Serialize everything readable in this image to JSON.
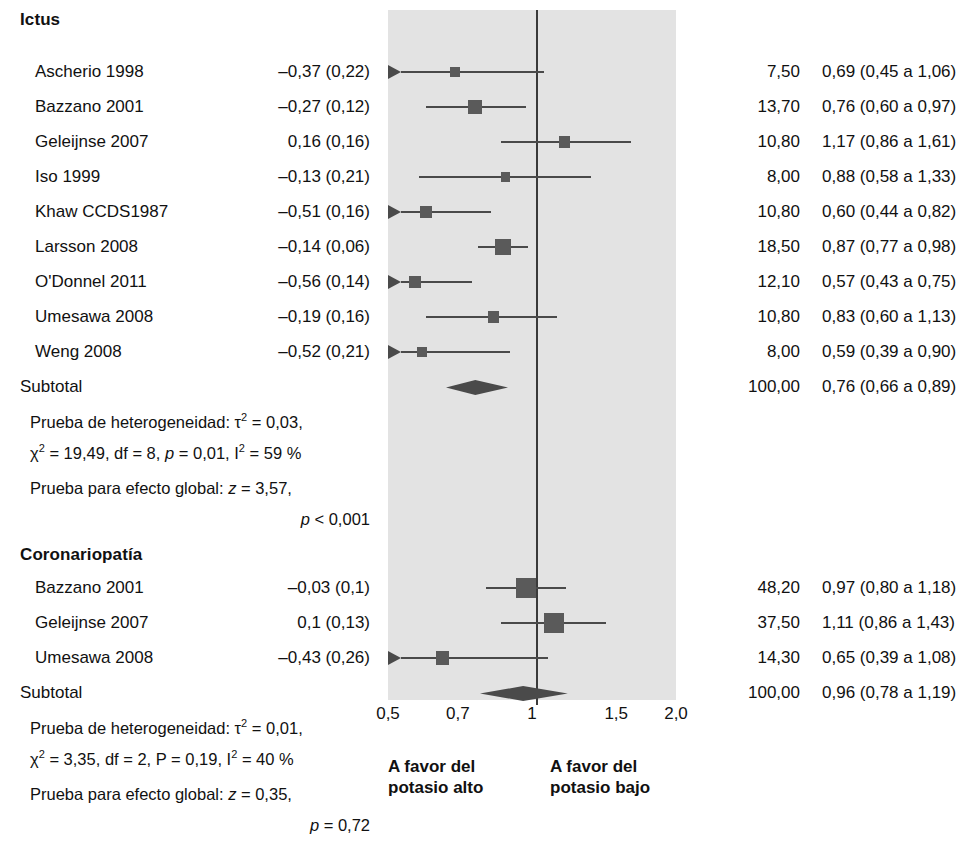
{
  "chart_data": {
    "type": "forest",
    "title": "",
    "xlabel": "",
    "axis": {
      "scale": "log",
      "ticks": [
        "0,5",
        "0,7",
        "1",
        "1,5",
        "2,0"
      ],
      "tick_values": [
        0.5,
        0.7,
        1.0,
        1.5,
        2.0
      ],
      "null_value": 1.0,
      "xlim": [
        0.5,
        2.0
      ]
    },
    "footer": {
      "left_line1": "A favor del",
      "left_line2": "potasio alto",
      "right_line1": "A favor del",
      "right_line2": "potasio bajo"
    },
    "columns": [
      "Estudio",
      "Efecto (EE)",
      "Peso %",
      "RR (IC 95 %)"
    ],
    "groups": [
      {
        "name": "Ictus",
        "rows": [
          {
            "study": "Ascherio 1998",
            "effect": "–0,37 (0,22)",
            "weight": "7,50",
            "rr_text": "0,69 (0,45 a 1,06)",
            "rr": 0.69,
            "lo": 0.45,
            "hi": 1.06,
            "w": 7.5,
            "arrow_left": true
          },
          {
            "study": "Bazzano 2001",
            "effect": "–0,27 (0,12)",
            "weight": "13,70",
            "rr_text": "0,76 (0,60 a 0,97)",
            "rr": 0.76,
            "lo": 0.6,
            "hi": 0.97,
            "w": 13.7,
            "arrow_left": false
          },
          {
            "study": "Geleijnse 2007",
            "effect": "0,16 (0,16)",
            "weight": "10,80",
            "rr_text": "1,17 (0,86 a 1,61)",
            "rr": 1.17,
            "lo": 0.86,
            "hi": 1.61,
            "w": 10.8,
            "arrow_left": false
          },
          {
            "study": "Iso 1999",
            "effect": "–0,13 (0,21)",
            "weight": "8,00",
            "rr_text": "0,88 (0,58 a 1,33)",
            "rr": 0.88,
            "lo": 0.58,
            "hi": 1.33,
            "w": 8.0,
            "arrow_left": false
          },
          {
            "study": "Khaw CCDS1987",
            "effect": "–0,51 (0,16)",
            "weight": "10,80",
            "rr_text": "0,60 (0,44 a 0,82)",
            "rr": 0.6,
            "lo": 0.44,
            "hi": 0.82,
            "w": 10.8,
            "arrow_left": true
          },
          {
            "study": "Larsson 2008",
            "effect": "–0,14 (0,06)",
            "weight": "18,50",
            "rr_text": "0,87 (0,77 a 0,98)",
            "rr": 0.87,
            "lo": 0.77,
            "hi": 0.98,
            "w": 18.5,
            "arrow_left": false
          },
          {
            "study": "O'Donnel 2011",
            "effect": "–0,56 (0,14)",
            "weight": "12,10",
            "rr_text": "0,57 (0,43 a 0,75)",
            "rr": 0.57,
            "lo": 0.43,
            "hi": 0.75,
            "w": 12.1,
            "arrow_left": true
          },
          {
            "study": "Umesawa 2008",
            "effect": "–0,19 (0,16)",
            "weight": "10,80",
            "rr_text": "0,83 (0,60 a 1,13)",
            "rr": 0.83,
            "lo": 0.6,
            "hi": 1.13,
            "w": 10.8,
            "arrow_left": false
          },
          {
            "study": "Weng 2008",
            "effect": "–0,52 (0,21)",
            "weight": "8,00",
            "rr_text": "0,59 (0,39 a 0,90)",
            "rr": 0.59,
            "lo": 0.39,
            "hi": 0.9,
            "w": 8.0,
            "arrow_left": true
          }
        ],
        "subtotal": {
          "label": "Subtotal",
          "weight": "100,00",
          "rr_text": "0,76 (0,66 a 0,89)",
          "rr": 0.76,
          "lo": 0.66,
          "hi": 0.89
        },
        "heterogeneity_line1": "Prueba de heterogeneidad: τ² = 0,03,",
        "heterogeneity_line2": "χ² = 19,49, df = 8, p = 0,01, I² = 59 %",
        "global_line1": "Prueba para efecto global:  z = 3,57,",
        "global_line2": "p < 0,001"
      },
      {
        "name": "Coronariopatía",
        "rows": [
          {
            "study": "Bazzano 2001",
            "effect": "–0,03 (0,1)",
            "weight": "48,20",
            "rr_text": "0,97 (0,80 a 1,18)",
            "rr": 0.97,
            "lo": 0.8,
            "hi": 1.18,
            "w": 48.2,
            "arrow_left": false
          },
          {
            "study": "Geleijnse 2007",
            "effect": "0,1 (0,13)",
            "weight": "37,50",
            "rr_text": "1,11 (0,86 a 1,43)",
            "rr": 1.11,
            "lo": 0.86,
            "hi": 1.43,
            "w": 37.5,
            "arrow_left": false
          },
          {
            "study": "Umesawa 2008",
            "effect": "–0,43 (0,26)",
            "weight": "14,30",
            "rr_text": "0,65 (0,39 a 1,08)",
            "rr": 0.65,
            "lo": 0.39,
            "hi": 1.08,
            "w": 14.3,
            "arrow_left": true
          }
        ],
        "subtotal": {
          "label": "Subtotal",
          "weight": "100,00",
          "rr_text": "0,96 (0,78 a 1,19)",
          "rr": 0.96,
          "lo": 0.78,
          "hi": 1.19
        },
        "heterogeneity_line1": "Prueba de heterogeneidad: τ² = 0,01,",
        "heterogeneity_line2": "χ² = 3,35, df = 2, P = 0,19, I² = 40 %",
        "global_line1": "Prueba para efecto global:  z = 0,35,",
        "global_line2": "p = 0,72"
      }
    ],
    "colors": {
      "band": "#e3e3e3",
      "marker": "#5a5a5a",
      "line": "#4a4a4a",
      "text": "#111111"
    }
  }
}
